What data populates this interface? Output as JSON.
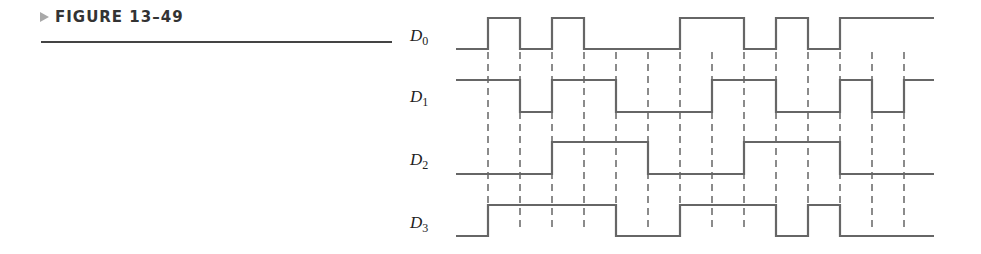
{
  "figure": {
    "caption": "FIGURE 13–49"
  },
  "diagram": {
    "type": "timing-diagram",
    "x_start": 456,
    "interval_width": 32,
    "x_end": 934,
    "boundaries": [
      488,
      520,
      552,
      584,
      616,
      648,
      680,
      712,
      744,
      776,
      808,
      840,
      872,
      904
    ],
    "dash_top": 52,
    "dash_bottom": 232,
    "line_color": "#666666",
    "signals": [
      {
        "name": "D",
        "sub": "0",
        "high_y": 18,
        "low_y": 49,
        "label_y": 41,
        "levels": [
          0,
          1,
          0,
          1,
          0,
          0,
          0,
          1,
          1,
          0,
          1,
          0,
          1,
          1,
          1
        ]
      },
      {
        "name": "D",
        "sub": "1",
        "high_y": 80,
        "low_y": 112,
        "label_y": 102,
        "levels": [
          1,
          1,
          0,
          1,
          1,
          0,
          0,
          0,
          1,
          1,
          0,
          0,
          1,
          0,
          1
        ]
      },
      {
        "name": "D",
        "sub": "2",
        "high_y": 142,
        "low_y": 174,
        "label_y": 165,
        "levels": [
          0,
          0,
          0,
          1,
          1,
          1,
          0,
          0,
          0,
          1,
          1,
          1,
          0,
          0,
          0
        ]
      },
      {
        "name": "D",
        "sub": "3",
        "high_y": 205,
        "low_y": 236,
        "label_y": 228,
        "levels": [
          0,
          1,
          1,
          1,
          1,
          0,
          0,
          1,
          1,
          1,
          0,
          1,
          0,
          0,
          0
        ]
      }
    ]
  }
}
